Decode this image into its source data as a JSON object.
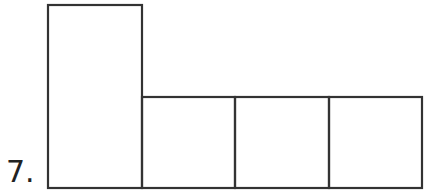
{
  "problem": {
    "number_label": "7."
  },
  "figure": {
    "stroke_color": "#333333",
    "shapes": [
      {
        "name": "tall-rectangle",
        "x": 48,
        "y": 5,
        "w": 94,
        "h": 183
      },
      {
        "name": "square-1",
        "x": 142,
        "y": 97,
        "w": 93,
        "h": 91
      },
      {
        "name": "square-2",
        "x": 235,
        "y": 97,
        "w": 94,
        "h": 91
      },
      {
        "name": "square-3",
        "x": 329,
        "y": 97,
        "w": 93,
        "h": 91
      }
    ]
  }
}
